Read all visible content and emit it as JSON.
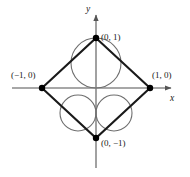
{
  "figure": {
    "axis_labels": {
      "x": "x",
      "y": "y"
    },
    "point_labels": {
      "top": "(0, 1)",
      "left": "(−1, 0)",
      "right": "(1, 0)",
      "bottom": "(0, −1)"
    },
    "colors": {
      "axis": "#8a8a8a",
      "diamond": "#1a1a1a",
      "circle": "#6e6e6e",
      "point": "#000000",
      "text": "#1a1a1a",
      "background": "#ffffff"
    },
    "geometry": {
      "origin": {
        "x": 96,
        "y": 88
      },
      "unit_x": 54,
      "unit_y": 50,
      "vertices": {
        "top": {
          "x": 96,
          "y": 38
        },
        "right": {
          "x": 150,
          "y": 88
        },
        "bottom": {
          "x": 96,
          "y": 138
        },
        "left": {
          "x": 42,
          "y": 88
        }
      },
      "x_axis": {
        "x1": 12,
        "x2": 178,
        "y": 88,
        "arrow": "right"
      },
      "y_axis": {
        "y1": 8,
        "y2": 168,
        "x": 96,
        "arrow": "up"
      },
      "circles": [
        {
          "name": "upper-large-circle",
          "cx": 96,
          "cy": 63,
          "r": 25
        },
        {
          "name": "lower-left-circle",
          "cx": 78,
          "cy": 113,
          "r": 18
        },
        {
          "name": "lower-right-circle",
          "cx": 114,
          "cy": 113,
          "r": 18
        }
      ],
      "point_radius": 3.2
    }
  }
}
